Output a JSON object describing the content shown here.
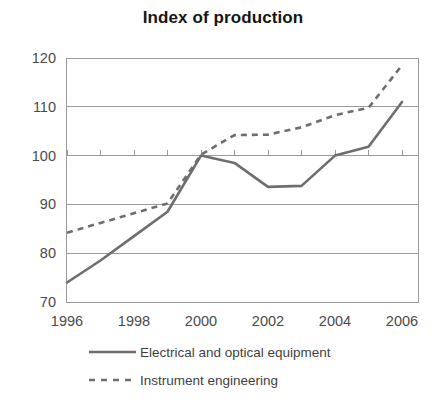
{
  "chart_data": {
    "type": "line",
    "title": "Index of production",
    "xlabel": "",
    "ylabel": "",
    "xlim": [
      1996,
      2006
    ],
    "ylim": [
      70,
      120
    ],
    "ytick_labels": [
      "120",
      "110",
      "100",
      "90",
      "80",
      "70"
    ],
    "yticks": [
      120,
      110,
      100,
      90,
      80,
      70
    ],
    "xtick_labels": [
      "1996",
      "1998",
      "2000",
      "2002",
      "2004",
      "2006"
    ],
    "xticks": [
      1996,
      1998,
      2000,
      2002,
      2004,
      2006
    ],
    "x": [
      1996,
      1997,
      1998,
      1999,
      2000,
      2001,
      2002,
      2003,
      2004,
      2005,
      2006
    ],
    "grid": "horizontal",
    "legend_position": "below",
    "series": [
      {
        "name": "Electrical and optical equipment",
        "style": "solid",
        "color": "#6e6e6e",
        "values": [
          74,
          78.5,
          83.5,
          88.5,
          100,
          98.5,
          93.6,
          93.8,
          100,
          101.8,
          111
        ]
      },
      {
        "name": "Instrument engineering",
        "style": "dashed",
        "color": "#6e6e6e",
        "values": [
          84.2,
          86.2,
          88.2,
          90.2,
          100.2,
          104.2,
          104.3,
          105.8,
          108.3,
          109.8,
          118.5
        ]
      }
    ]
  },
  "legend": {
    "entries": [
      {
        "label": "Electrical and optical equipment",
        "style": "solid"
      },
      {
        "label": "Instrument engineering",
        "style": "dashed"
      }
    ]
  },
  "axes": {
    "plot_left": 66,
    "plot_right": 418,
    "plot_top": 58,
    "plot_bottom": 302,
    "data_x_start": 67,
    "data_x_step": 33.5
  }
}
